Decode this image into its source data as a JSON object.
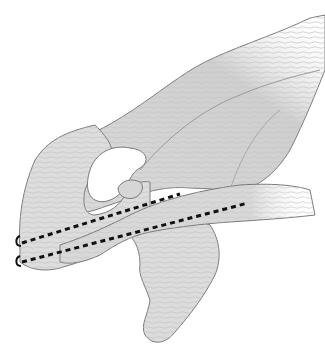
{
  "figure": {
    "background": "#ffffff",
    "bone_fill": "#d9d9d9",
    "bone_fill_light": "#e6e6e6",
    "bone_shadow": "#b5b5b5",
    "outline": "#7a7a7a",
    "dashed_line_color": "#111111",
    "dashed_lines": [
      {
        "name": "upper-trajectory",
        "from": [
          18,
          243
        ],
        "to": [
          180,
          194
        ]
      },
      {
        "name": "lower-trajectory",
        "from": [
          18,
          262
        ],
        "to": [
          248,
          203
        ]
      }
    ]
  }
}
